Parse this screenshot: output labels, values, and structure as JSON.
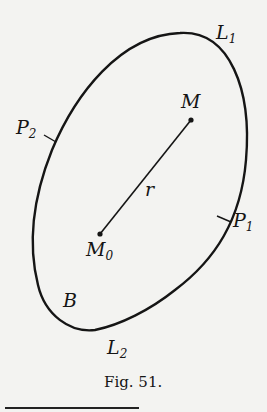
{
  "figure": {
    "caption": "Fig. 51.",
    "labels": {
      "L1": {
        "base": "L",
        "sub": "1"
      },
      "L2": {
        "base": "L",
        "sub": "2"
      },
      "P1": {
        "base": "P",
        "sub": "1"
      },
      "P2": {
        "base": "P",
        "sub": "2"
      },
      "M": {
        "base": "M"
      },
      "M0": {
        "base": "M",
        "sub": "0"
      },
      "r": {
        "base": "r"
      },
      "B": {
        "base": "B"
      }
    },
    "colors": {
      "stroke": "#151515",
      "background": "#f3f3f1"
    }
  }
}
